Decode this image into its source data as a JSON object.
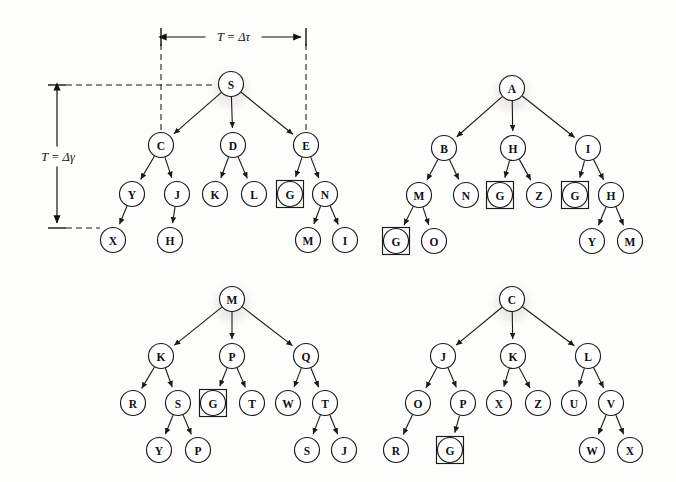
{
  "figure": {
    "background_color": "#fdfdfc",
    "ink_color": "#1a1a1a"
  },
  "annotations": {
    "horizontal_measure": {
      "label": "T = Δτ",
      "x_start": 161,
      "x_end": 306,
      "y": 37
    },
    "vertical_measure": {
      "label": "T = Δγ",
      "y_start": 85,
      "y_end": 228,
      "x": 57
    }
  },
  "node_radius": 12.5,
  "goal_box_half": 13.5,
  "trees": [
    {
      "id": "tree-top-left",
      "root": "S",
      "nodes": [
        {
          "id": "tl-S",
          "label": "S",
          "x": 231,
          "y": 84,
          "goal": false,
          "root": true
        },
        {
          "id": "tl-C",
          "label": "C",
          "x": 161,
          "y": 145,
          "goal": false,
          "root": false
        },
        {
          "id": "tl-D",
          "label": "D",
          "x": 233,
          "y": 145,
          "goal": false,
          "root": false
        },
        {
          "id": "tl-E",
          "label": "E",
          "x": 306,
          "y": 145,
          "goal": false,
          "root": false
        },
        {
          "id": "tl-Y",
          "label": "Y",
          "x": 132,
          "y": 194,
          "goal": false,
          "root": false
        },
        {
          "id": "tl-J",
          "label": "J",
          "x": 177,
          "y": 194,
          "goal": false,
          "root": false
        },
        {
          "id": "tl-K",
          "label": "K",
          "x": 215,
          "y": 194,
          "goal": false,
          "root": false
        },
        {
          "id": "tl-L",
          "label": "L",
          "x": 254,
          "y": 194,
          "goal": false,
          "root": false
        },
        {
          "id": "tl-G",
          "label": "G",
          "x": 290,
          "y": 194,
          "goal": true,
          "root": false
        },
        {
          "id": "tl-N",
          "label": "N",
          "x": 325,
          "y": 194,
          "goal": false,
          "root": false
        },
        {
          "id": "tl-X",
          "label": "X",
          "x": 113,
          "y": 240,
          "goal": false,
          "root": false
        },
        {
          "id": "tl-H",
          "label": "H",
          "x": 170,
          "y": 240,
          "goal": false,
          "root": false
        },
        {
          "id": "tl-M",
          "label": "M",
          "x": 308,
          "y": 240,
          "goal": false,
          "root": false
        },
        {
          "id": "tl-I",
          "label": "I",
          "x": 345,
          "y": 240,
          "goal": false,
          "root": false
        }
      ],
      "edges": [
        [
          "tl-S",
          "tl-C"
        ],
        [
          "tl-S",
          "tl-D"
        ],
        [
          "tl-S",
          "tl-E"
        ],
        [
          "tl-C",
          "tl-Y"
        ],
        [
          "tl-C",
          "tl-J"
        ],
        [
          "tl-D",
          "tl-K"
        ],
        [
          "tl-D",
          "tl-L"
        ],
        [
          "tl-E",
          "tl-G"
        ],
        [
          "tl-E",
          "tl-N"
        ],
        [
          "tl-Y",
          "tl-X"
        ],
        [
          "tl-J",
          "tl-H"
        ],
        [
          "tl-N",
          "tl-M"
        ],
        [
          "tl-N",
          "tl-I"
        ]
      ]
    },
    {
      "id": "tree-top-right",
      "root": "A",
      "nodes": [
        {
          "id": "tr-A",
          "label": "A",
          "x": 512,
          "y": 88,
          "goal": false,
          "root": true
        },
        {
          "id": "tr-B",
          "label": "B",
          "x": 444,
          "y": 148,
          "goal": false,
          "root": false
        },
        {
          "id": "tr-H1",
          "label": "H",
          "x": 513,
          "y": 148,
          "goal": false,
          "root": false
        },
        {
          "id": "tr-I",
          "label": "I",
          "x": 588,
          "y": 148,
          "goal": false,
          "root": false
        },
        {
          "id": "tr-M",
          "label": "M",
          "x": 419,
          "y": 195,
          "goal": false,
          "root": false
        },
        {
          "id": "tr-N",
          "label": "N",
          "x": 466,
          "y": 195,
          "goal": false,
          "root": false
        },
        {
          "id": "tr-G1",
          "label": "G",
          "x": 500,
          "y": 195,
          "goal": true,
          "root": false
        },
        {
          "id": "tr-Z",
          "label": "Z",
          "x": 539,
          "y": 195,
          "goal": false,
          "root": false
        },
        {
          "id": "tr-G2",
          "label": "G",
          "x": 575,
          "y": 195,
          "goal": true,
          "root": false
        },
        {
          "id": "tr-H2",
          "label": "H",
          "x": 611,
          "y": 195,
          "goal": false,
          "root": false
        },
        {
          "id": "tr-G3",
          "label": "G",
          "x": 396,
          "y": 241,
          "goal": true,
          "root": false
        },
        {
          "id": "tr-O",
          "label": "O",
          "x": 434,
          "y": 241,
          "goal": false,
          "root": false
        },
        {
          "id": "tr-Y",
          "label": "Y",
          "x": 592,
          "y": 241,
          "goal": false,
          "root": false
        },
        {
          "id": "tr-M2",
          "label": "M",
          "x": 630,
          "y": 241,
          "goal": false,
          "root": false
        }
      ],
      "edges": [
        [
          "tr-A",
          "tr-B"
        ],
        [
          "tr-A",
          "tr-H1"
        ],
        [
          "tr-A",
          "tr-I"
        ],
        [
          "tr-B",
          "tr-M"
        ],
        [
          "tr-B",
          "tr-N"
        ],
        [
          "tr-H1",
          "tr-G1"
        ],
        [
          "tr-H1",
          "tr-Z"
        ],
        [
          "tr-I",
          "tr-G2"
        ],
        [
          "tr-I",
          "tr-H2"
        ],
        [
          "tr-M",
          "tr-G3"
        ],
        [
          "tr-M",
          "tr-O"
        ],
        [
          "tr-H2",
          "tr-Y"
        ],
        [
          "tr-H2",
          "tr-M2"
        ]
      ]
    },
    {
      "id": "tree-bottom-left",
      "root": "M",
      "nodes": [
        {
          "id": "bl-M",
          "label": "M",
          "x": 232,
          "y": 299,
          "goal": false,
          "root": true
        },
        {
          "id": "bl-K",
          "label": "K",
          "x": 161,
          "y": 356,
          "goal": false,
          "root": false
        },
        {
          "id": "bl-P",
          "label": "P",
          "x": 232,
          "y": 356,
          "goal": false,
          "root": false
        },
        {
          "id": "bl-Q",
          "label": "Q",
          "x": 306,
          "y": 356,
          "goal": false,
          "root": false
        },
        {
          "id": "bl-R",
          "label": "R",
          "x": 133,
          "y": 403,
          "goal": false,
          "root": false
        },
        {
          "id": "bl-S",
          "label": "S",
          "x": 178,
          "y": 403,
          "goal": false,
          "root": false
        },
        {
          "id": "bl-G",
          "label": "G",
          "x": 213,
          "y": 403,
          "goal": true,
          "root": false
        },
        {
          "id": "bl-T1",
          "label": "T",
          "x": 252,
          "y": 403,
          "goal": false,
          "root": false
        },
        {
          "id": "bl-W",
          "label": "W",
          "x": 288,
          "y": 403,
          "goal": false,
          "root": false
        },
        {
          "id": "bl-T2",
          "label": "T",
          "x": 325,
          "y": 403,
          "goal": false,
          "root": false
        },
        {
          "id": "bl-Y",
          "label": "Y",
          "x": 159,
          "y": 450,
          "goal": false,
          "root": false
        },
        {
          "id": "bl-P2",
          "label": "P",
          "x": 198,
          "y": 450,
          "goal": false,
          "root": false
        },
        {
          "id": "bl-S2",
          "label": "S",
          "x": 307,
          "y": 450,
          "goal": false,
          "root": false
        },
        {
          "id": "bl-J",
          "label": "J",
          "x": 344,
          "y": 450,
          "goal": false,
          "root": false
        }
      ],
      "edges": [
        [
          "bl-M",
          "bl-K"
        ],
        [
          "bl-M",
          "bl-P"
        ],
        [
          "bl-M",
          "bl-Q"
        ],
        [
          "bl-K",
          "bl-R"
        ],
        [
          "bl-K",
          "bl-S"
        ],
        [
          "bl-P",
          "bl-G"
        ],
        [
          "bl-P",
          "bl-T1"
        ],
        [
          "bl-Q",
          "bl-W"
        ],
        [
          "bl-Q",
          "bl-T2"
        ],
        [
          "bl-S",
          "bl-Y"
        ],
        [
          "bl-S",
          "bl-P2"
        ],
        [
          "bl-T2",
          "bl-S2"
        ],
        [
          "bl-T2",
          "bl-J"
        ]
      ]
    },
    {
      "id": "tree-bottom-right",
      "root": "C",
      "nodes": [
        {
          "id": "br-C",
          "label": "C",
          "x": 512,
          "y": 299,
          "goal": false,
          "root": true
        },
        {
          "id": "br-J",
          "label": "J",
          "x": 443,
          "y": 356,
          "goal": false,
          "root": false
        },
        {
          "id": "br-K",
          "label": "K",
          "x": 513,
          "y": 356,
          "goal": false,
          "root": false
        },
        {
          "id": "br-L",
          "label": "L",
          "x": 588,
          "y": 356,
          "goal": false,
          "root": false
        },
        {
          "id": "br-O",
          "label": "O",
          "x": 418,
          "y": 403,
          "goal": false,
          "root": false
        },
        {
          "id": "br-P",
          "label": "P",
          "x": 463,
          "y": 403,
          "goal": false,
          "root": false
        },
        {
          "id": "br-X1",
          "label": "X",
          "x": 499,
          "y": 403,
          "goal": false,
          "root": false
        },
        {
          "id": "br-Z",
          "label": "Z",
          "x": 538,
          "y": 403,
          "goal": false,
          "root": false
        },
        {
          "id": "br-U",
          "label": "U",
          "x": 574,
          "y": 403,
          "goal": false,
          "root": false
        },
        {
          "id": "br-V",
          "label": "V",
          "x": 611,
          "y": 403,
          "goal": false,
          "root": false
        },
        {
          "id": "br-R",
          "label": "R",
          "x": 396,
          "y": 450,
          "goal": false,
          "root": false
        },
        {
          "id": "br-G",
          "label": "G",
          "x": 450,
          "y": 450,
          "goal": true,
          "root": false
        },
        {
          "id": "br-W",
          "label": "W",
          "x": 592,
          "y": 450,
          "goal": false,
          "root": false
        },
        {
          "id": "br-X2",
          "label": "X",
          "x": 630,
          "y": 450,
          "goal": false,
          "root": false
        }
      ],
      "edges": [
        [
          "br-C",
          "br-J"
        ],
        [
          "br-C",
          "br-K"
        ],
        [
          "br-C",
          "br-L"
        ],
        [
          "br-J",
          "br-O"
        ],
        [
          "br-J",
          "br-P"
        ],
        [
          "br-K",
          "br-X1"
        ],
        [
          "br-K",
          "br-Z"
        ],
        [
          "br-L",
          "br-U"
        ],
        [
          "br-L",
          "br-V"
        ],
        [
          "br-O",
          "br-R"
        ],
        [
          "br-P",
          "br-G"
        ],
        [
          "br-V",
          "br-W"
        ],
        [
          "br-V",
          "br-X2"
        ]
      ]
    }
  ],
  "reference_lines": {
    "vertical_dashes": [
      {
        "x": 161,
        "y_top": 44,
        "y_bottom": 140
      },
      {
        "x": 306,
        "y_top": 44,
        "y_bottom": 140
      }
    ],
    "horizontal_dashes": [
      {
        "y": 85,
        "x_left": 66,
        "x_right": 212
      },
      {
        "y": 228,
        "x_left": 66,
        "x_right": 100
      }
    ]
  }
}
